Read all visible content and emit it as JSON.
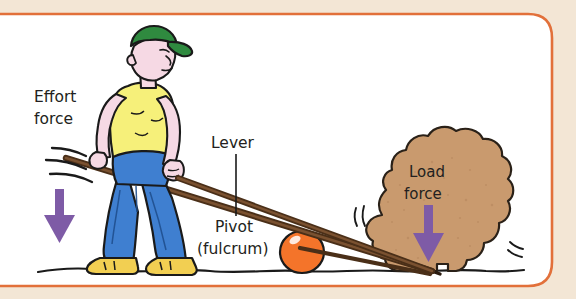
{
  "figure": {
    "background_color": "#f3e6d5",
    "panel_color": "#ffffff",
    "border_color": "#e2703a",
    "labels": {
      "effort_line1": "Effort",
      "effort_line2": "force",
      "lever": "Lever",
      "pivot_line1": "Pivot",
      "pivot_line2": "(fulcrum)",
      "load_line1": "Load",
      "load_line2": "force"
    },
    "colors": {
      "arrow_purple": "#7e5ba6",
      "cap_green": "#2f8a3f",
      "shirt_yellow": "#f6f07a",
      "jeans_blue": "#3f7fd0",
      "boot_yellow": "#f2cf52",
      "skin_pink": "#f6d9e4",
      "ball_orange": "#f4742a",
      "rock_tan": "#c99a6e",
      "lever_brown": "#5a3a20",
      "ground_black": "#1a1a1a",
      "text_black": "#231f20"
    },
    "elements": {
      "person": "worker pushing down on lever",
      "lever_bar": "long brown bar",
      "fulcrum_ball": "orange ball",
      "rock": "large tan boulder being lifted",
      "effort_arrow": "purple down arrow at left",
      "load_arrow": "purple down arrow on rock",
      "motion_lines_left": "speed lines near lever end",
      "motion_lines_rock": "speed lines near rock",
      "ground_line": "wavy ground line"
    }
  }
}
